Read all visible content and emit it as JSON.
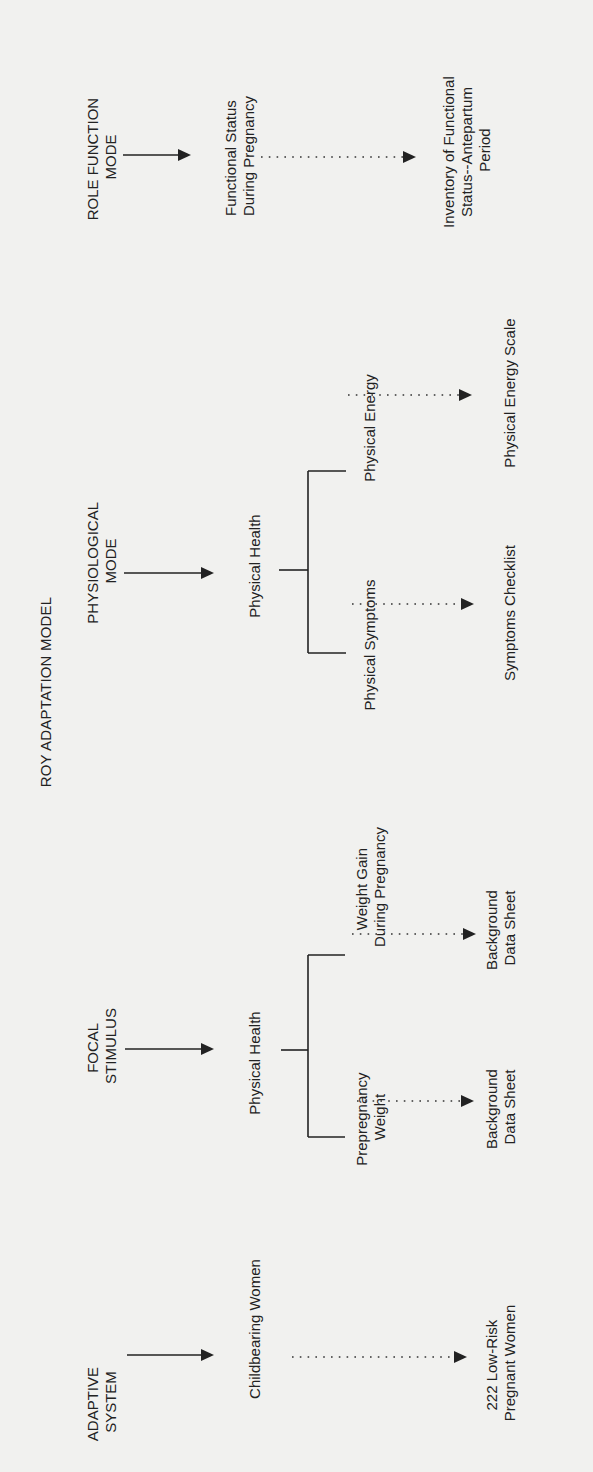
{
  "title": "ROY ADAPTATION MODEL",
  "colors": {
    "background": "#f1f1ef",
    "ink": "#222222"
  },
  "columns": [
    {
      "concept": [
        "ADAPTIVE",
        "SYSTEM"
      ],
      "variable": [
        "Childbearing Women"
      ],
      "measures": [
        {
          "indicator": null,
          "instrument": [
            "222 Low-Risk",
            "Pregnant Women"
          ]
        }
      ]
    },
    {
      "concept": [
        "FOCAL",
        "STIMULUS"
      ],
      "variable": [
        "Physical Health"
      ],
      "measures": [
        {
          "indicator": [
            "Prepregnancy",
            "Weight"
          ],
          "instrument": [
            "Background",
            "Data Sheet"
          ]
        },
        {
          "indicator": [
            "Weight Gain",
            "During Pregnancy"
          ],
          "instrument": [
            "Background",
            "Data Sheet"
          ]
        }
      ]
    },
    {
      "concept": [
        "PHYSIOLOGICAL",
        "MODE"
      ],
      "variable": [
        "Physical Health"
      ],
      "measures": [
        {
          "indicator": [
            "Physical Symptoms"
          ],
          "instrument": [
            "Symptoms Checklist"
          ]
        },
        {
          "indicator": [
            "Physical Energy"
          ],
          "instrument": [
            "Physical Energy Scale"
          ]
        }
      ]
    },
    {
      "concept": [
        "ROLE FUNCTION",
        "MODE"
      ],
      "variable": [
        "Functional Status",
        "During Pregnancy"
      ],
      "measures": [
        {
          "indicator": null,
          "instrument": [
            "Inventory of Functional",
            "Status--Antepartum",
            "Period"
          ]
        }
      ]
    }
  ],
  "arrow_legend": {
    "solid": "concept-to-variable",
    "dotted": "variable-to-measurement"
  }
}
